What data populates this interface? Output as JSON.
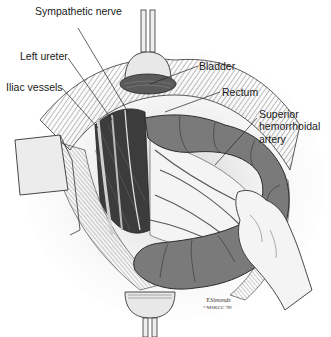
{
  "figure": {
    "type": "anatomical-illustration",
    "colors": {
      "background": "#ffffff",
      "colon": "#7a7a7a",
      "colon_shadow": "#5e5e5e",
      "tissue_dark": "#3a3a3a",
      "retractor": "#e6e6e6",
      "line": "#222222",
      "glove": "#f2f2f2"
    }
  },
  "labels": {
    "sympathetic_nerve": "Sympathetic nerve",
    "left_ureter": "Left ureter",
    "iliac_vessels": "Iliac vessels",
    "bladder": "Bladder",
    "rectum": "Rectum",
    "superior_hemorrhoidal_artery_l1": "Superior",
    "superior_hemorrhoidal_artery_l2": "hemorrhoidal",
    "superior_hemorrhoidal_artery_l3": "artery"
  },
  "signature": {
    "artist": "Y.Simonds",
    "copyright": "©MSKCC '99"
  }
}
